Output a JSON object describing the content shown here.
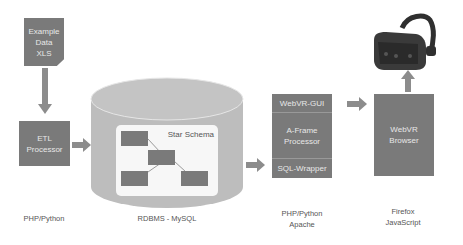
{
  "nodes": {
    "data_file": {
      "lines": [
        "Example",
        "Data",
        "XLS"
      ]
    },
    "etl": {
      "lines": [
        "ETL",
        "Processor"
      ]
    },
    "database": {
      "schema_label": "Star Schema"
    },
    "server": {
      "top": "WebVR-GUI",
      "middle": [
        "A-Frame",
        "Processor"
      ],
      "bottom": "SQL-Wrapper"
    },
    "browser": {
      "lines": [
        "WebVR",
        "Browser"
      ]
    },
    "headset": {
      "icon": "vr-headset-icon"
    }
  },
  "labels": {
    "etl": [
      "PHP/Python"
    ],
    "database": [
      "RDBMS - MySQL"
    ],
    "server": [
      "PHP/Python",
      "Apache"
    ],
    "browser": [
      "Firefox",
      "JavaScript"
    ]
  },
  "colors": {
    "box": "#7a7a7a",
    "arrow": "#8c8c8c",
    "cylinder": "#bdbdbd",
    "text": "#555555"
  }
}
